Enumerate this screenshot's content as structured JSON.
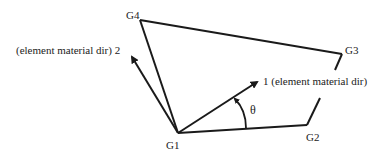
{
  "diagram": {
    "nodes": {
      "g1": {
        "label": "G1",
        "x": 178,
        "y": 133
      },
      "g2": {
        "label": "G2",
        "x": 307,
        "y": 125
      },
      "g3": {
        "label": "G3",
        "x": 342,
        "y": 54
      },
      "g4": {
        "label": "G4",
        "x": 140,
        "y": 20
      }
    },
    "axes": {
      "dir1": {
        "label": "1 (element material dir)",
        "tip_x": 259,
        "tip_y": 81
      },
      "dir2": {
        "label": "(element material dir) 2",
        "tip_x": 130,
        "tip_y": 55
      }
    },
    "angle": {
      "label": "θ"
    },
    "colors": {
      "stroke": "#1a1a1a",
      "text": "#222222",
      "background": "#ffffff"
    }
  }
}
